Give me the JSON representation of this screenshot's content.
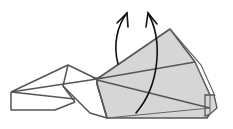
{
  "diagram": {
    "type": "origami-fold-step",
    "description": "Partially folded origami model with shaded fan-shaped flap and two curved arrows indicating an upward fold",
    "colors": {
      "background": "#ffffff",
      "outline": "#555555",
      "shade": "#d3d3d3",
      "arrow": "#111111"
    },
    "elements": {
      "left_body": {
        "label": "unshaded left body"
      },
      "fan_flap": {
        "label": "shaded fan flap"
      },
      "arrows": [
        {
          "label": "fold arrow left",
          "direction": "up"
        },
        {
          "label": "fold arrow right",
          "direction": "up"
        }
      ]
    }
  }
}
